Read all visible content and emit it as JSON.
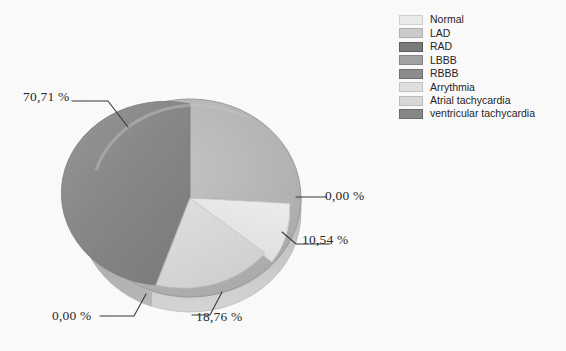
{
  "chart_data": {
    "type": "pie",
    "title": "",
    "subtitle": "",
    "xlabel": "",
    "ylabel": "",
    "decimal_separator": ",",
    "value_suffix": "%",
    "legend_position": "top-right",
    "grid": false,
    "three_d": true,
    "categories": [
      "Normal",
      "LAD",
      "RAD",
      "LBBB",
      "RBBB",
      "Arrythmia",
      "Atrial tachycardia",
      "ventricular tachycardia"
    ],
    "values": [
      70.71,
      0.0,
      10.54,
      0.0,
      18.76,
      0.0,
      0.0,
      0.0
    ],
    "visible_labels": [
      "70,71 %",
      "0,00 %",
      "10,54 %",
      "0,00 %",
      "18,76 %"
    ],
    "slices": [
      {
        "label": "Normal",
        "value": 70.71,
        "display": "70,71 %",
        "color": "#8c8c8c",
        "side_color": "#9a9a9a"
      },
      {
        "label": "LAD",
        "value": 0.0,
        "display": "0,00 %",
        "color": "#d8d8d8",
        "side_color": "#c6c6c6"
      },
      {
        "label": "RAD",
        "value": 10.54,
        "display": "10,54 %",
        "color": "#f2f2f2",
        "side_color": "#dcdcdc"
      },
      {
        "label": "LBBB",
        "value": 0.0,
        "display": "0,00 %",
        "color": "#b5b5b5",
        "side_color": "#a8a8a8"
      },
      {
        "label": "RBBB",
        "value": 18.76,
        "display": "18,76 %",
        "color": "#dedede",
        "side_color": "#cacaca"
      },
      {
        "label": "Arrythmia",
        "value": 0.0,
        "display": "0,00 %",
        "color": "#ededed",
        "side_color": "#d9d9d9"
      },
      {
        "label": "Atrial tachycardia",
        "value": 0.0,
        "display": "0,00 %",
        "color": "#e6e6e6",
        "side_color": "#d2d2d2"
      },
      {
        "label": "ventricular tachycardia",
        "value": 0.0,
        "display": "0,00 %",
        "color": "#8f8f8f",
        "side_color": "#828282"
      }
    ]
  },
  "labels": {
    "normal_pct": "70,71 %",
    "lad_pct": "0,00 %",
    "rad_pct": "10,54 %",
    "rbbb_pct": "18,76 %",
    "lbbb_pct": "0,00 %"
  },
  "legend": {
    "items": [
      {
        "label": "Normal",
        "color": "#efefef"
      },
      {
        "label": "LAD",
        "color": "#cfcfcf"
      },
      {
        "label": "RAD",
        "color": "#7d7d7d"
      },
      {
        "label": "LBBB",
        "color": "#a5a5a5"
      },
      {
        "label": "RBBB",
        "color": "#909090"
      },
      {
        "label": "Arrythmia",
        "color": "#e4e4e4"
      },
      {
        "label": "Atrial tachycardia",
        "color": "#dcdcdc"
      },
      {
        "label": "ventricular tachycardia",
        "color": "#8a8a8a"
      }
    ]
  }
}
